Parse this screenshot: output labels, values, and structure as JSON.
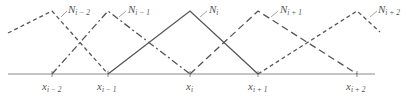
{
  "diagram": {
    "type": "piecewise-linear hat basis functions",
    "colors": {
      "axis": "#8a8a8a",
      "curve": "#555555",
      "leader": "#9a9a9a",
      "text": "#555555"
    },
    "nodes": [
      {
        "id": "x_i-2",
        "base": "x",
        "sub": "i − 2",
        "x": 52
      },
      {
        "id": "x_i-1",
        "base": "x",
        "sub": "i − 1",
        "x": 108
      },
      {
        "id": "x_i",
        "base": "x",
        "sub": "i",
        "x": 190
      },
      {
        "id": "x_i+1",
        "base": "x",
        "sub": "i + 1",
        "x": 258
      },
      {
        "id": "x_i+2",
        "base": "x",
        "sub": "i + 2",
        "x": 357
      }
    ],
    "functions": [
      {
        "id": "N_i-2",
        "base": "N",
        "sub": "i − 2",
        "style": "short-dash",
        "peak_node": "x_i-2"
      },
      {
        "id": "N_i-1",
        "base": "N",
        "sub": "i − 1",
        "style": "dash-dot",
        "peak_node": "x_i-1"
      },
      {
        "id": "N_i",
        "base": "N",
        "sub": "i",
        "style": "solid",
        "peak_node": "x_i"
      },
      {
        "id": "N_i+1",
        "base": "N",
        "sub": "i + 1",
        "style": "long-dash",
        "peak_node": "x_i+1"
      },
      {
        "id": "N_i+2",
        "base": "N",
        "sub": "i + 2",
        "style": "short-dash",
        "peak_node": "x_i+2"
      }
    ]
  }
}
